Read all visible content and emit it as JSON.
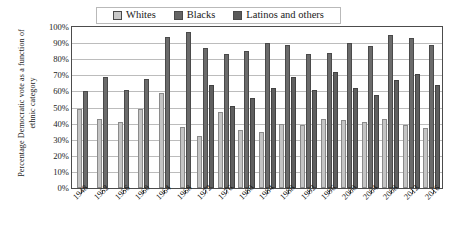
{
  "chart_data": {
    "type": "bar",
    "title": "",
    "subtitle": "",
    "xlabel": "",
    "ylabel": "Percentage Democratic vote as a function of ethnic category",
    "ylim": [
      0,
      100
    ],
    "ytick_labels": [
      "100%",
      "90%",
      "80%",
      "70%",
      "60%",
      "50%",
      "40%",
      "30%",
      "20%",
      "10%",
      "0%"
    ],
    "ytick_values": [
      100,
      90,
      80,
      70,
      60,
      50,
      40,
      30,
      20,
      10,
      0
    ],
    "grid": true,
    "legend_position": "top",
    "categories": [
      "1948",
      "1952",
      "1956",
      "1960",
      "1964",
      "1968",
      "1972",
      "1976",
      "1980",
      "1984",
      "1988",
      "1992",
      "1996",
      "2000",
      "2004",
      "2008",
      "2012",
      "2016"
    ],
    "series": [
      {
        "name": "Whites",
        "color": "#c4c4c4",
        "values": [
          49,
          43,
          41,
          49,
          59,
          38,
          32,
          47,
          36,
          35,
          40,
          39,
          43,
          42,
          41,
          43,
          39,
          37
        ]
      },
      {
        "name": "Blacks",
        "color": "#6b6b6b",
        "values": [
          60,
          69,
          61,
          68,
          94,
          97,
          87,
          83,
          85,
          90,
          89,
          83,
          84,
          90,
          88,
          95,
          93,
          89
        ]
      },
      {
        "name": "Latinos and others",
        "color": "#5f5f5f",
        "values": [
          null,
          null,
          null,
          null,
          null,
          null,
          64,
          51,
          56,
          62,
          69,
          61,
          72,
          62,
          58,
          67,
          71,
          64
        ]
      }
    ]
  },
  "legend": {
    "items": [
      {
        "label": "Whites",
        "swatch": "whites-swatch-icon"
      },
      {
        "label": "Blacks",
        "swatch": "blacks-swatch-icon"
      },
      {
        "label": "Latinos and others",
        "swatch": "latinos-swatch-icon"
      }
    ]
  }
}
